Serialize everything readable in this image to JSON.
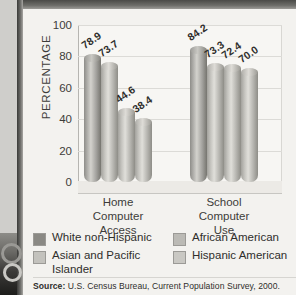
{
  "chart_data": {
    "type": "bar",
    "title": "",
    "xlabel": "",
    "ylabel": "PERCENTAGE",
    "ylim": [
      0,
      100
    ],
    "yticks": [
      "100",
      "80",
      "60",
      "40",
      "20",
      "0"
    ],
    "grid": true,
    "legend_position": "bottom",
    "categories": [
      "Home Computer Access",
      "School Computer Use"
    ],
    "category_lines": [
      [
        "Home",
        "Computer",
        "Access"
      ],
      [
        "School",
        "Computer",
        "Use"
      ]
    ],
    "series": [
      {
        "name": "White non-Hispanic",
        "values": [
          78.9,
          84.2
        ],
        "swatch": "s1"
      },
      {
        "name": "Asian and Pacific Islander",
        "values": [
          73.7,
          73.3
        ],
        "swatch": "s2"
      },
      {
        "name": "African American",
        "values": [
          44.6,
          72.4
        ],
        "swatch": "s3"
      },
      {
        "name": "Hispanic American",
        "values": [
          38.4,
          70.0
        ],
        "swatch": "s4"
      }
    ],
    "data_labels": {
      "group1": [
        "78.9",
        "73.7",
        "44.6",
        "38.4"
      ],
      "group2": [
        "84.2",
        "73.3",
        "72.4",
        "70.0"
      ]
    }
  },
  "legend": {
    "left": [
      {
        "label": "White non-Hispanic",
        "swatch": "s1"
      },
      {
        "label": "Asian and Pacific Islander",
        "swatch": "s2"
      }
    ],
    "right": [
      {
        "label": "African American",
        "swatch": "s3"
      },
      {
        "label": "Hispanic American",
        "swatch": "s4"
      }
    ]
  },
  "source": {
    "prefix": "Source:",
    "text": "U.S. Census Bureau, Current Population Survey, 2000."
  },
  "colors": {
    "page_background": "#b9b8b4",
    "card_background": "#f3f2ef",
    "plot_background": "#f7f6f3",
    "gridline": "#dcdbd7",
    "axis": "#b6b5b1",
    "text": "#2f2e2c",
    "bar_dark": "#8e8d89",
    "bar_light": "#c6c5c0"
  }
}
